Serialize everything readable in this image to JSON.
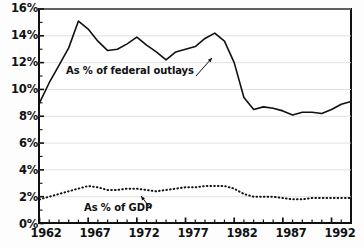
{
  "chart_data": {
    "type": "line",
    "title": "",
    "subtitle": "",
    "xlabel": "",
    "ylabel": "",
    "grid": "horizontal",
    "legend_position": "inline-annotation",
    "xlim": [
      1962,
      1994
    ],
    "ylim": [
      0,
      16
    ],
    "x_ticks_major": [
      1962,
      1967,
      1972,
      1977,
      1982,
      1987,
      1992
    ],
    "x_tick_labels": [
      "1962",
      "1967",
      "1972",
      "1977",
      "1982",
      "1987",
      "1992"
    ],
    "x_ticks_minor_every": 1,
    "y_ticks": [
      0,
      2,
      4,
      6,
      8,
      10,
      12,
      14,
      16
    ],
    "y_tick_labels": [
      "0%",
      "2%",
      "4%",
      "6%",
      "8%",
      "10%",
      "12%",
      "14%",
      "16%"
    ],
    "x": [
      1962,
      1963,
      1964,
      1965,
      1966,
      1967,
      1968,
      1969,
      1970,
      1971,
      1972,
      1973,
      1974,
      1975,
      1976,
      1977,
      1978,
      1979,
      1980,
      1981,
      1982,
      1983,
      1984,
      1985,
      1986,
      1987,
      1988,
      1989,
      1990,
      1991,
      1992,
      1993,
      1994
    ],
    "series": [
      {
        "name": "As % of federal outlays",
        "style": "solid",
        "color": "#111111",
        "values": [
          9.0,
          10.5,
          11.8,
          13.1,
          15.1,
          14.5,
          13.6,
          12.9,
          13.0,
          13.4,
          13.9,
          13.3,
          12.8,
          12.2,
          12.8,
          13.0,
          13.2,
          13.8,
          14.2,
          13.6,
          12.0,
          9.4,
          8.5,
          8.7,
          8.6,
          8.4,
          8.1,
          8.3,
          8.3,
          8.2,
          8.5,
          8.9,
          9.1
        ]
      },
      {
        "name": "As % of GDP",
        "style": "dotted",
        "color": "#111111",
        "values": [
          1.8,
          2.0,
          2.2,
          2.4,
          2.6,
          2.8,
          2.7,
          2.5,
          2.5,
          2.6,
          2.6,
          2.5,
          2.4,
          2.5,
          2.6,
          2.7,
          2.7,
          2.8,
          2.8,
          2.8,
          2.6,
          2.2,
          2.0,
          2.0,
          2.0,
          1.9,
          1.8,
          1.8,
          1.9,
          1.9,
          1.9,
          1.9,
          1.9
        ]
      }
    ],
    "annotations": [
      {
        "text": "As % of federal outlays",
        "points_to_year": 1980,
        "points_to_value": 13.2
      },
      {
        "text": "As % of GDP",
        "points_to_year": 1978,
        "points_to_value": 2.65
      }
    ]
  },
  "axis": {
    "y_labels": [
      "16%",
      "14%",
      "12%",
      "10%",
      "8%",
      "6%",
      "4%",
      "2%",
      "0%"
    ],
    "x_labels": [
      "1962",
      "1967",
      "1972",
      "1977",
      "1982",
      "1987",
      "1992"
    ]
  },
  "annotations": {
    "outlays": "As % of federal outlays",
    "gdp": "As % of GDP"
  }
}
